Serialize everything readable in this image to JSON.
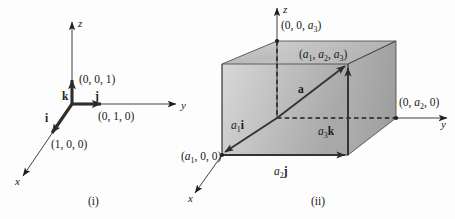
{
  "figure": {
    "background_color": "#fdfdfd",
    "ink_color": "#1a1a1a",
    "shade_color": "#b9b9b9"
  },
  "panel_i": {
    "caption": "(i)",
    "axes": [
      {
        "name": "z-axis",
        "label": "z"
      },
      {
        "name": "y-axis",
        "label": "y"
      },
      {
        "name": "x-axis",
        "label": "x"
      }
    ],
    "vectors": [
      {
        "name": "k",
        "label": "k",
        "tip_point_label": "(0, 0, 1)"
      },
      {
        "name": "j",
        "label": "j",
        "tip_point_label": "(0, 1, 0)"
      },
      {
        "name": "i",
        "label": "i",
        "tip_point_label": "(1, 0, 0)"
      }
    ],
    "point_labels": {
      "z_unit": "(0, 0, 1)",
      "y_unit": "(0, 1, 0)",
      "x_unit": "(1, 0, 0)"
    },
    "vector_labels": {
      "k": "k",
      "j": "j",
      "i": "i"
    }
  },
  "panel_ii": {
    "caption": "(ii)",
    "axes": [
      {
        "name": "z-axis",
        "label": "z"
      },
      {
        "name": "y-axis",
        "label": "y"
      },
      {
        "name": "x-axis",
        "label": "x"
      }
    ],
    "point_labels": {
      "z_intercept_pre": "(0, 0, ",
      "z_intercept_sub": "3",
      "z_intercept_post": ")",
      "corner_pre": "(",
      "corner_a1": "1",
      "corner_mid": ", ",
      "corner_a2": "2",
      "corner_a3": "3",
      "corner_post": ")",
      "y_intercept": "(0, a2, 0)",
      "x_intercept": "(a1, 0, 0)"
    },
    "text": {
      "z_intercept": "(0, 0, a3)",
      "tip_point": "(a1, a2, a3)",
      "y_intercept": "(0, a2, 0)",
      "x_intercept": "(a1, 0, 0)",
      "vector_a": "a",
      "comp_x": "a1i",
      "comp_y": "a2j",
      "comp_z": "a3k",
      "axis_z": "z",
      "axis_y": "y",
      "axis_x": "x"
    },
    "components": [
      {
        "name": "a1-i",
        "base": "a",
        "sub": "1",
        "unit": "i"
      },
      {
        "name": "a2-j",
        "base": "a",
        "sub": "2",
        "unit": "j"
      },
      {
        "name": "a3-k",
        "base": "a",
        "sub": "3",
        "unit": "k"
      }
    ],
    "resultant_label": "a"
  },
  "letters": {
    "a": "a",
    "i": "i",
    "j": "j",
    "k": "k",
    "x": "x",
    "y": "y",
    "z": "z",
    "zero": "0",
    "one": "1",
    "comma_space": ", ",
    "lparen": "(",
    "rparen": ")",
    "sub1": "1",
    "sub2": "2",
    "sub3": "3"
  }
}
